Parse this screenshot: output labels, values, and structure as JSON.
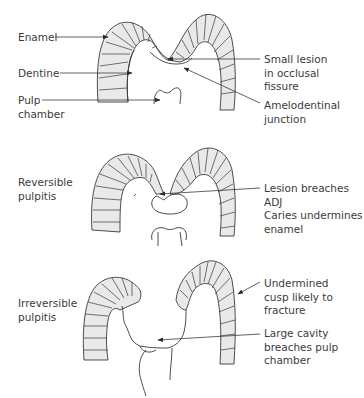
{
  "figure": {
    "panels": [
      {
        "id": "normal",
        "left_labels": [
          {
            "text": "Enamel"
          },
          {
            "lines": [
              "Dentine"
            ]
          },
          {
            "lines": [
              "Pulp",
              "chamber"
            ]
          }
        ],
        "right_labels": [
          {
            "lines": [
              "Small lesion",
              "in occlusal",
              "fissure"
            ]
          },
          {
            "lines": [
              "Amelodentinal",
              "junction"
            ]
          }
        ]
      },
      {
        "id": "reversible",
        "left_label": {
          "lines": [
            "Reversible",
            "pulpitis"
          ]
        },
        "right_label": {
          "lines": [
            "Lesion breaches",
            "ADJ",
            "Caries undermines",
            "enamel"
          ]
        }
      },
      {
        "id": "irreversible",
        "left_label": {
          "lines": [
            "Irreversible",
            "pulpitis"
          ]
        },
        "right_labels": [
          {
            "lines": [
              "Undermined",
              "cusp likely to",
              "fracture"
            ]
          },
          {
            "lines": [
              "Large cavity",
              "breaches pulp",
              "chamber"
            ]
          }
        ]
      }
    ],
    "colors": {
      "enamel_fill": "#e9e9e9",
      "line": "#3a3a3a",
      "background": "#ffffff"
    }
  }
}
